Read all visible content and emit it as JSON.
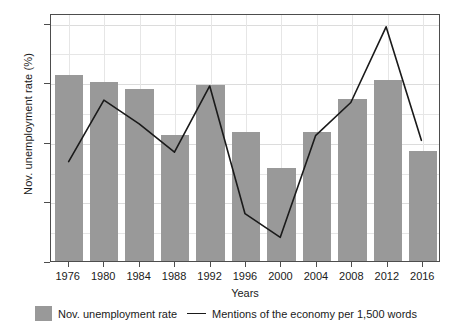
{
  "chart_data": {
    "type": "bar",
    "title": "",
    "xlabel": "Years",
    "ylabel": "Nov. unemployment rate (%)",
    "categories": [
      "1976",
      "1980",
      "1984",
      "1988",
      "1992",
      "1996",
      "2000",
      "2004",
      "2008",
      "2012",
      "2016"
    ],
    "ylim": [
      0,
      10.4
    ],
    "yticks": [
      0.0,
      2.5,
      5.0,
      7.5,
      10.0
    ],
    "ytick_labels": [
      "0.0",
      "2.5",
      "5.0",
      "7.5",
      "10.0"
    ],
    "grid": true,
    "legend_position": "bottom",
    "series": [
      {
        "name": "Nov. unemployment rate",
        "type": "bar",
        "color": "#999999",
        "values": [
          7.8,
          7.5,
          7.2,
          5.3,
          7.4,
          5.4,
          3.9,
          5.4,
          6.8,
          7.6,
          4.6
        ]
      },
      {
        "name": "Mentions of the economy per 1,500 words",
        "type": "line",
        "color": "#1a1a1a",
        "values": [
          4.2,
          6.8,
          5.8,
          4.6,
          7.4,
          2.0,
          1.0,
          5.3,
          6.7,
          9.9,
          5.1
        ]
      }
    ]
  },
  "axis": {
    "y_title": "Nov. unemployment rate (%)",
    "x_title": "Years"
  },
  "legend": {
    "bar_label": "Nov. unemployment rate",
    "line_label": "Mentions of the economy per 1,500 words"
  }
}
